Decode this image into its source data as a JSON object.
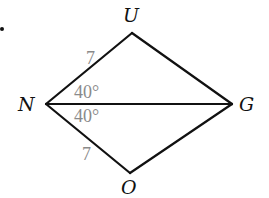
{
  "diagram": {
    "type": "kite",
    "vertices": [
      {
        "name": "U",
        "x": 132,
        "y": 33
      },
      {
        "name": "N",
        "x": 46,
        "y": 104
      },
      {
        "name": "G",
        "x": 232,
        "y": 104
      },
      {
        "name": "O",
        "x": 130,
        "y": 173
      }
    ],
    "labels": {
      "U": "U",
      "N": "N",
      "G": "G",
      "O": "O"
    },
    "measures": {
      "side_NU": "7",
      "side_NO": "7",
      "angle_UNG": "40°",
      "angle_GNO": "40°"
    },
    "bullet": "."
  }
}
